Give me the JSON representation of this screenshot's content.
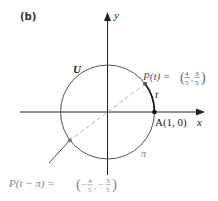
{
  "figure": {
    "panel_label": "(b)",
    "axes": {
      "x_label": "x",
      "y_label": "y"
    },
    "circle_label": "U",
    "arc_label_t": "t",
    "arc_label_pi": "π",
    "point_A": {
      "label": "A(1, 0)",
      "coords": [
        1,
        0
      ]
    },
    "point_P_t": {
      "label_prefix": "P(t) = ",
      "x_num": "4",
      "x_den": "5",
      "y_num": "3",
      "y_den": "5",
      "coords": [
        0.8,
        0.6
      ]
    },
    "point_P_t_minus_pi": {
      "label_prefix": "P(t − π) = ",
      "x_num": "4",
      "x_den": "5",
      "y_num": "3",
      "y_den": "5",
      "x_sign": "−",
      "y_sign": "−",
      "coords": [
        -0.8,
        -0.6
      ]
    },
    "colors": {
      "axis": "#222222",
      "circle": "#555555",
      "arc_t": "#111111",
      "dashed_diameter": "#b0b0b0",
      "text_dark": "#222222",
      "text_gray": "#888888"
    }
  }
}
